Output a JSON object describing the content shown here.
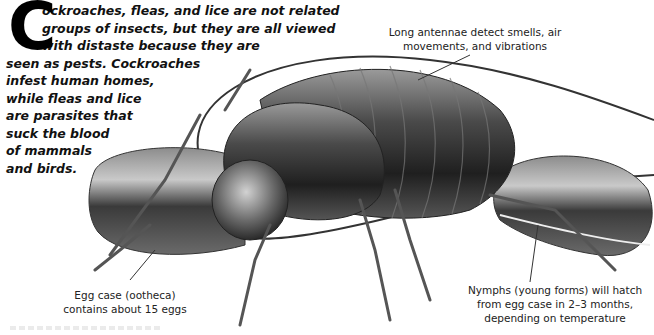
{
  "intro": {
    "dropcap": "C",
    "lines": [
      "ockroaches, fleas, and lice are not related",
      "groups of insects, but they are all viewed",
      "with distaste because they are",
      "seen as pests. Cockroaches",
      "infest human homes,",
      "while fleas and lice",
      "are parasites that",
      "suck the blood",
      "of mammals",
      "and birds."
    ]
  },
  "labels": {
    "antennae": [
      "Long antennae detect smells, air",
      "movements, and vibrations"
    ],
    "egg_case": [
      "Egg case (ootheca)",
      "contains about 15 eggs"
    ],
    "nymphs": [
      "Nymphs (young forms) will hatch",
      "from egg case in 2–3 months,",
      "depending on temperature"
    ]
  },
  "illustration": {
    "subject": "cockroach-with-egg-cases",
    "colors": {
      "dark": "#2a2a2a",
      "mid": "#6e6e6e",
      "light": "#bdbdbd",
      "line": "#333333"
    }
  }
}
